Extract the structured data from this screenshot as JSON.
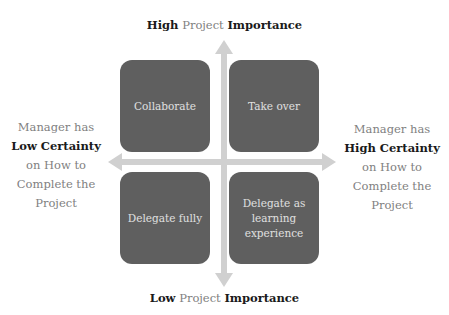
{
  "top_label": {
    "pre": "High",
    "mid": "Project",
    "post": "Importance"
  },
  "bottom_label": {
    "pre": "Low",
    "mid": "Project",
    "post": "Importance"
  },
  "left_label": {
    "line1": "Manager has",
    "bold": "Low Certainty",
    "line3": "on How to",
    "line4": "Complete the",
    "line5": "Project"
  },
  "right_label": {
    "line1": "Manager has",
    "bold": "High Certainty",
    "line3": "on How to",
    "line4": "Complete the",
    "line5": "Project"
  },
  "quadrants": {
    "top_left": "Collaborate",
    "top_right": "Take over",
    "bottom_left": "Delegate fully",
    "bottom_right": "Delegate as learning experience"
  },
  "colors": {
    "box": "#5f5f5f",
    "box_text": "#e0e0e0",
    "arrow": "#cfcfcf",
    "muted_text": "#7f7f7f",
    "bold_text": "#1a1a1a"
  }
}
